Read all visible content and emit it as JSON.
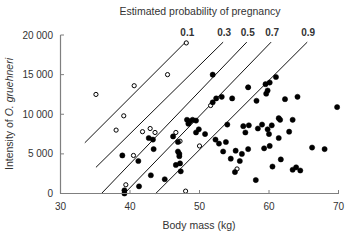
{
  "chart_data": {
    "type": "scatter",
    "title": "Estimated probability of pregnancy",
    "xlabel": "Body mass (kg)",
    "ylabel": "Intensity of O. gruehneri",
    "ylabel_prefix": "Intensity of ",
    "ylabel_italic": "O. gruehneri",
    "xlim": [
      30,
      70
    ],
    "ylim": [
      0,
      20000
    ],
    "x_ticks": [
      30,
      40,
      50,
      60,
      70
    ],
    "x_tick_labels": [
      "30",
      "40",
      "50",
      "60",
      "70"
    ],
    "y_ticks": [
      0,
      5000,
      10000,
      15000,
      20000
    ],
    "y_tick_labels": [
      "0",
      "5 000",
      "10 000",
      "15 000",
      "20 000"
    ],
    "grid": false,
    "probability_lines": [
      {
        "label": "0.1",
        "x1": 33.5,
        "y1": 6400,
        "x2": 48.1,
        "y2": 19200
      },
      {
        "label": "0.3",
        "x1": 35.1,
        "y1": 3300,
        "x2": 53.4,
        "y2": 19100
      },
      {
        "label": "0.5",
        "x1": 35.9,
        "y1": 0,
        "x2": 56.8,
        "y2": 19100
      },
      {
        "label": "0.7",
        "x1": 39.2,
        "y1": 0,
        "x2": 60.3,
        "y2": 19100
      },
      {
        "label": "0.9",
        "x1": 43.7,
        "y1": 0,
        "x2": 65.5,
        "y2": 19100
      }
    ],
    "series": [
      {
        "name": "open (not pregnant)",
        "marker": "open-circle",
        "points": [
          [
            35.1,
            12500
          ],
          [
            38.0,
            8000
          ],
          [
            39.1,
            9800
          ],
          [
            39.4,
            1100
          ],
          [
            40.5,
            4800
          ],
          [
            40.6,
            13600
          ],
          [
            41.8,
            7800
          ],
          [
            42.9,
            8200
          ],
          [
            43.6,
            7700
          ],
          [
            45.4,
            15000
          ],
          [
            46.6,
            7700
          ],
          [
            47.2,
            6600
          ],
          [
            48.1,
            19000
          ],
          [
            48.0,
            300
          ],
          [
            51.6,
            11100
          ],
          [
            50.0,
            6000
          ],
          [
            55.4,
            3100
          ],
          [
            57.0,
            13400
          ]
        ]
      },
      {
        "name": "filled (pregnant)",
        "marker": "filled-circle",
        "points": [
          [
            39.2,
            400
          ],
          [
            39.2,
            0
          ],
          [
            38.9,
            4800
          ],
          [
            41.2,
            4100
          ],
          [
            41.3,
            900
          ],
          [
            42.7,
            7000
          ],
          [
            43.3,
            6800
          ],
          [
            43.4,
            5600
          ],
          [
            43.0,
            2300
          ],
          [
            45.0,
            1800
          ],
          [
            46.2,
            7200
          ],
          [
            46.9,
            6500
          ],
          [
            46.9,
            5300
          ],
          [
            47.1,
            5000
          ],
          [
            47.1,
            4700
          ],
          [
            47.2,
            3800
          ],
          [
            46.6,
            3600
          ],
          [
            47.3,
            2800
          ],
          [
            48.4,
            8800
          ],
          [
            48.6,
            9100
          ],
          [
            48.2,
            9300
          ],
          [
            49.0,
            9300
          ],
          [
            49.5,
            9200
          ],
          [
            49.5,
            7700
          ],
          [
            49.9,
            8100
          ],
          [
            50.8,
            7500
          ],
          [
            51.9,
            15000
          ],
          [
            51.9,
            11500
          ],
          [
            52.3,
            6800
          ],
          [
            52.8,
            6300
          ],
          [
            53.4,
            5300
          ],
          [
            53.8,
            6500
          ],
          [
            54.0,
            8700
          ],
          [
            54.5,
            4400
          ],
          [
            55.1,
            2700
          ],
          [
            55.2,
            5400
          ],
          [
            55.8,
            4100
          ],
          [
            56.3,
            8500
          ],
          [
            56.6,
            7700
          ],
          [
            57.1,
            8600
          ],
          [
            57.0,
            13400
          ],
          [
            58.2,
            11700
          ],
          [
            58.1,
            1700
          ],
          [
            59.0,
            8700
          ],
          [
            59.6,
            12600
          ],
          [
            59.5,
            13800
          ],
          [
            60.1,
            14000
          ],
          [
            59.8,
            13000
          ],
          [
            60.4,
            8600
          ],
          [
            60.5,
            3400
          ],
          [
            59.8,
            8100
          ],
          [
            61.0,
            14700
          ],
          [
            61.4,
            9500
          ],
          [
            61.6,
            9300
          ],
          [
            62.3,
            11900
          ],
          [
            61.4,
            7000
          ],
          [
            62.9,
            7800
          ],
          [
            63.4,
            9300
          ],
          [
            63.9,
            3300
          ],
          [
            64.5,
            2900
          ],
          [
            66.2,
            5800
          ],
          [
            64.1,
            12200
          ],
          [
            63.4,
            3000
          ],
          [
            68.0,
            5600
          ],
          [
            69.8,
            10900
          ],
          [
            60.0,
            7500
          ],
          [
            57.0,
            5600
          ],
          [
            52.4,
            12000
          ],
          [
            53.2,
            12200
          ],
          [
            54.7,
            12000
          ],
          [
            56.1,
            5000
          ],
          [
            58.4,
            8200
          ],
          [
            60.1,
            6000
          ],
          [
            59.3,
            5700
          ],
          [
            61.7,
            4300
          ]
        ]
      }
    ]
  }
}
